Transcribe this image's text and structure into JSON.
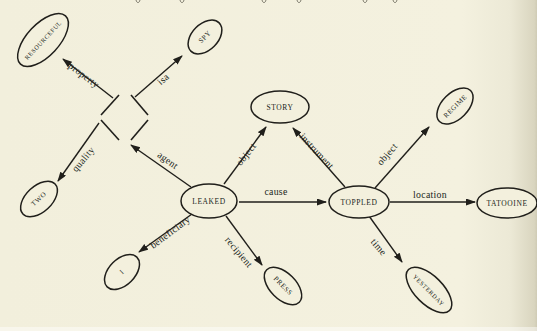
{
  "figure": {
    "width": 537,
    "height": 331,
    "paper_color": "#f3f0dd",
    "ink_color": "#201f1b",
    "page_edge_shadow_color": "#cfcbb5"
  },
  "top_fragments": {
    "note": "descender tips of a cropped text line at top edge",
    "xs": [
      136,
      180,
      262,
      297,
      363,
      393
    ]
  },
  "diagram": {
    "nodes": [
      {
        "id": "resourceful",
        "label": "RESOURCEFUL",
        "cx": 43,
        "cy": 40,
        "rx": 33,
        "ry": 16,
        "rot": -47,
        "fs": 6.2
      },
      {
        "id": "spy",
        "label": "SPY",
        "cx": 205,
        "cy": 37,
        "rx": 20,
        "ry": 13,
        "rot": -45,
        "fs": 7
      },
      {
        "id": "two",
        "label": "TWO",
        "cx": 39,
        "cy": 199,
        "rx": 22,
        "ry": 13,
        "rot": -43,
        "fs": 7
      },
      {
        "id": "i",
        "label": "I",
        "cx": 122,
        "cy": 272,
        "rx": 21,
        "ry": 13,
        "rot": -45,
        "fs": 7
      },
      {
        "id": "leaked",
        "label": "LEAKED",
        "cx": 209,
        "cy": 201,
        "rx": 28,
        "ry": 17,
        "rot": 0,
        "fs": 7.5
      },
      {
        "id": "story",
        "label": "STORY",
        "cx": 280,
        "cy": 107,
        "rx": 29,
        "ry": 16,
        "rot": 0,
        "fs": 7.5
      },
      {
        "id": "toppled",
        "label": "TOPPLED",
        "cx": 359,
        "cy": 202,
        "rx": 30,
        "ry": 16,
        "rot": 0,
        "fs": 7.5
      },
      {
        "id": "regime",
        "label": "REGIME",
        "cx": 455,
        "cy": 106,
        "rx": 22,
        "ry": 13,
        "rot": -45,
        "fs": 6.8
      },
      {
        "id": "tatooine",
        "label": "TATOOINE",
        "cx": 507,
        "cy": 203,
        "rx": 30,
        "ry": 15,
        "rot": 0,
        "fs": 7.5
      },
      {
        "id": "press",
        "label": "PRESS",
        "cx": 283,
        "cy": 286,
        "rx": 23,
        "ry": 13,
        "rot": 45,
        "fs": 7
      },
      {
        "id": "yesterday",
        "label": "YESTERDAY",
        "cx": 429,
        "cy": 290,
        "rx": 29,
        "ry": 14,
        "rot": 45,
        "fs": 6.2
      }
    ],
    "diamond": {
      "id": "unnamed-entity",
      "segments": [
        [
          101,
          115,
          119,
          95
        ],
        [
          131,
          95,
          148,
          115
        ],
        [
          101,
          120,
          119,
          140
        ],
        [
          131,
          140,
          148,
          120
        ]
      ]
    },
    "edges": [
      {
        "label": "property",
        "from": "unnamed-entity",
        "to": "resourceful",
        "x1": 113,
        "y1": 98,
        "x2": 63,
        "y2": 59,
        "lx": 84,
        "ly": 75,
        "lr": 37
      },
      {
        "label": "isa",
        "from": "unnamed-entity",
        "to": "spy",
        "x1": 135,
        "y1": 97,
        "x2": 182,
        "y2": 56,
        "lx": 163,
        "ly": 79,
        "lr": -41
      },
      {
        "label": "quality",
        "from": "unnamed-entity",
        "to": "two",
        "x1": 99,
        "y1": 123,
        "x2": 58,
        "y2": 181,
        "lx": 83,
        "ly": 159,
        "lr": -50
      },
      {
        "label": "agent",
        "from": "leaked",
        "to": "unnamed-entity",
        "x1": 191,
        "y1": 187,
        "x2": 131,
        "y2": 145,
        "lx": 168,
        "ly": 160,
        "lr": 36
      },
      {
        "label": "object",
        "from": "leaked",
        "to": "story",
        "x1": 224,
        "y1": 184,
        "x2": 266,
        "y2": 127,
        "lx": 246,
        "ly": 154,
        "lr": -52
      },
      {
        "label": "cause",
        "from": "leaked",
        "to": "toppled",
        "x1": 239,
        "y1": 202,
        "x2": 326,
        "y2": 202,
        "lx": 276,
        "ly": 191,
        "lr": 0
      },
      {
        "label": "beneficiary",
        "from": "leaked",
        "to": "i",
        "x1": 192,
        "y1": 214,
        "x2": 139,
        "y2": 252,
        "lx": 170,
        "ly": 232,
        "lr": -37
      },
      {
        "label": "recipient",
        "from": "leaked",
        "to": "press",
        "x1": 226,
        "y1": 216,
        "x2": 262,
        "y2": 265,
        "lx": 239,
        "ly": 252,
        "lr": 50
      },
      {
        "label": "instrument",
        "from": "toppled",
        "to": "story",
        "x1": 345,
        "y1": 187,
        "x2": 293,
        "y2": 128,
        "lx": 317,
        "ly": 151,
        "lr": 47
      },
      {
        "label": "object",
        "from": "toppled",
        "to": "regime",
        "x1": 375,
        "y1": 188,
        "x2": 429,
        "y2": 127,
        "lx": 387,
        "ly": 154,
        "lr": -49
      },
      {
        "label": "location",
        "from": "toppled",
        "to": "tatooine",
        "x1": 390,
        "y1": 202,
        "x2": 475,
        "y2": 202,
        "lx": 430,
        "ly": 194,
        "lr": 0
      },
      {
        "label": "time",
        "from": "toppled",
        "to": "yesterday",
        "x1": 369,
        "y1": 216,
        "x2": 402,
        "y2": 262,
        "lx": 379,
        "ly": 247,
        "lr": 50
      }
    ]
  }
}
